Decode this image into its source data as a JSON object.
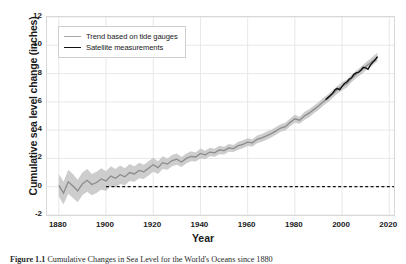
{
  "figure": {
    "caption_label": "Figure 1.1",
    "caption_text": "Cumulative Changes in Sea Level for the World's Oceans since 1880"
  },
  "chart_data": {
    "type": "line",
    "title": "",
    "xlabel": "Year",
    "ylabel": "Cumulative sea level change (inches)",
    "xlim": [
      1875,
      2022
    ],
    "ylim": [
      -2,
      12
    ],
    "xticks": [
      1880,
      1900,
      1920,
      1940,
      1960,
      1980,
      2000,
      2020
    ],
    "yticks": [
      -2,
      0,
      2,
      4,
      6,
      8,
      10,
      12
    ],
    "grid": true,
    "legend_position": "upper left",
    "colors": {
      "trend_line": "#8c8c8c",
      "uncertainty_band": "#c4c4c4",
      "satellite_line": "#111111",
      "gridline": "#e8e8e8",
      "zero_reference": "#111111"
    },
    "annotations": [
      {
        "name": "zero-reference-line",
        "type": "dashed-horizontal",
        "y": 0,
        "x_start": 1900,
        "x_end": 2022
      }
    ],
    "series": [
      {
        "name": "Trend based on tide gauges",
        "style": "line-with-band",
        "color": "#8c8c8c",
        "x": [
          1880,
          1882,
          1884,
          1886,
          1888,
          1890,
          1892,
          1894,
          1896,
          1898,
          1900,
          1902,
          1904,
          1906,
          1908,
          1910,
          1912,
          1914,
          1916,
          1918,
          1920,
          1922,
          1924,
          1926,
          1928,
          1930,
          1932,
          1934,
          1936,
          1938,
          1940,
          1942,
          1944,
          1946,
          1948,
          1950,
          1952,
          1954,
          1956,
          1958,
          1960,
          1962,
          1964,
          1966,
          1968,
          1970,
          1972,
          1974,
          1976,
          1978,
          1980,
          1982,
          1984,
          1986,
          1988,
          1990,
          1992,
          1994,
          1996,
          1998,
          2000,
          2002,
          2004,
          2006,
          2008,
          2010,
          2012,
          2014,
          2015
        ],
        "values": [
          0.1,
          -0.45,
          0.35,
          0.05,
          -0.3,
          0.2,
          0.45,
          0.15,
          0.3,
          0.55,
          0.4,
          0.75,
          0.6,
          0.85,
          0.7,
          1.0,
          0.9,
          1.15,
          1.05,
          1.3,
          1.55,
          1.35,
          1.7,
          1.6,
          1.85,
          1.95,
          1.75,
          2.0,
          2.15,
          2.1,
          2.35,
          2.25,
          2.45,
          2.4,
          2.6,
          2.55,
          2.75,
          2.7,
          2.9,
          3.0,
          3.15,
          3.1,
          3.35,
          3.45,
          3.6,
          3.75,
          3.95,
          4.15,
          4.25,
          4.55,
          4.8,
          4.7,
          5.0,
          5.2,
          5.45,
          5.7,
          6.0,
          6.25,
          6.55,
          6.85,
          7.1,
          7.3,
          7.65,
          7.95,
          8.2,
          8.5,
          8.75,
          9.05,
          9.15
        ],
        "band_lower": [
          -0.7,
          -1.25,
          -0.5,
          -0.8,
          -1.1,
          -0.6,
          -0.35,
          -0.6,
          -0.45,
          -0.2,
          -0.3,
          0.05,
          -0.05,
          0.2,
          0.1,
          0.4,
          0.35,
          0.6,
          0.55,
          0.8,
          1.05,
          0.9,
          1.25,
          1.2,
          1.45,
          1.55,
          1.4,
          1.65,
          1.8,
          1.78,
          2.0,
          1.95,
          2.15,
          2.12,
          2.3,
          2.28,
          2.48,
          2.45,
          2.62,
          2.72,
          2.88,
          2.85,
          3.08,
          3.18,
          3.32,
          3.48,
          3.68,
          3.88,
          3.98,
          4.28,
          4.52,
          4.45,
          4.72,
          4.92,
          5.18,
          5.42,
          5.72,
          5.98,
          6.28,
          6.58,
          6.82,
          7.02,
          7.38,
          7.68,
          7.92,
          8.22,
          8.45,
          8.75,
          8.85
        ],
        "band_upper": [
          0.9,
          0.35,
          1.2,
          0.9,
          0.5,
          1.0,
          1.25,
          0.9,
          1.05,
          1.3,
          1.1,
          1.45,
          1.25,
          1.5,
          1.3,
          1.6,
          1.45,
          1.7,
          1.55,
          1.8,
          2.05,
          1.8,
          2.15,
          2.0,
          2.25,
          2.35,
          2.1,
          2.35,
          2.5,
          2.42,
          2.7,
          2.55,
          2.75,
          2.68,
          2.9,
          2.82,
          3.02,
          2.95,
          3.18,
          3.28,
          3.42,
          3.35,
          3.62,
          3.72,
          3.88,
          4.02,
          4.22,
          4.42,
          4.52,
          4.82,
          5.08,
          4.95,
          5.28,
          5.48,
          5.72,
          5.98,
          6.28,
          6.52,
          6.82,
          7.12,
          7.38,
          7.58,
          7.92,
          8.22,
          8.48,
          8.78,
          9.05,
          9.35,
          9.45
        ]
      },
      {
        "name": "Satellite measurements",
        "style": "line",
        "color": "#111111",
        "x": [
          1993,
          1994,
          1995,
          1996,
          1997,
          1998,
          1999,
          2000,
          2001,
          2002,
          2003,
          2004,
          2005,
          2006,
          2007,
          2008,
          2009,
          2010,
          2011,
          2012,
          2013,
          2014,
          2015
        ],
        "values": [
          6.15,
          6.3,
          6.45,
          6.6,
          6.85,
          6.95,
          6.85,
          7.1,
          7.3,
          7.4,
          7.6,
          7.7,
          7.95,
          8.05,
          8.1,
          8.25,
          8.45,
          8.4,
          8.3,
          8.6,
          8.8,
          8.95,
          9.2
        ]
      }
    ]
  },
  "legend": {
    "items": [
      {
        "label": "Trend based on tide gauges",
        "color": "#a8a8a8"
      },
      {
        "label": "Satellite measurements",
        "color": "#111111"
      }
    ]
  }
}
